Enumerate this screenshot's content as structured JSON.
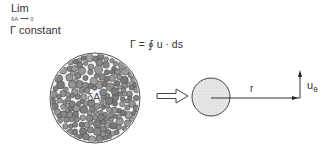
{
  "labels": {
    "lim": "Lim",
    "lim_sub": "δA ⟶ 0",
    "gamma_constant": "Γ constant",
    "formula": "Γ = ∮ u · ds",
    "delta_a": "δA",
    "r": "r",
    "u": "u",
    "theta": "θ"
  },
  "shapes": {
    "big_circle": {
      "cx": 95,
      "cy": 98,
      "r": 45,
      "fill": "#f2f2f2",
      "stroke": "#555555"
    },
    "small_circle": {
      "cx": 211,
      "cy": 97,
      "r": 19,
      "fill": "#e4e4e4",
      "stroke": "#444444"
    },
    "hollow_arrow": {
      "x1": 157,
      "x2": 188,
      "y": 96
    },
    "radius_line": {
      "x1": 211,
      "x2": 300,
      "y": 98
    },
    "velocity_arrow": {
      "x": 300,
      "y1": 98,
      "y2": 71
    },
    "particle_color": "#8a8a8a",
    "particle_stroke": "#4a4a4a",
    "particle_count": 170
  }
}
